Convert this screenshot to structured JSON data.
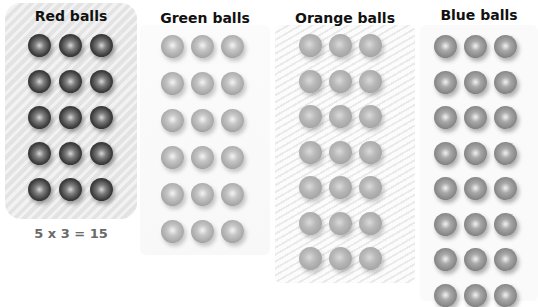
{
  "groups": [
    {
      "id": "red",
      "title": "Red balls",
      "rows": 5,
      "cols": 3,
      "highlighted": true
    },
    {
      "id": "green",
      "title": "Green balls",
      "rows": 6,
      "cols": 3,
      "highlighted": false
    },
    {
      "id": "orange",
      "title": "Orange balls",
      "rows": 7,
      "cols": 3,
      "highlighted": false
    },
    {
      "id": "blue",
      "title": "Blue balls",
      "rows": 8,
      "cols": 3,
      "highlighted": false
    }
  ],
  "equation": "5 x 3 = 15"
}
